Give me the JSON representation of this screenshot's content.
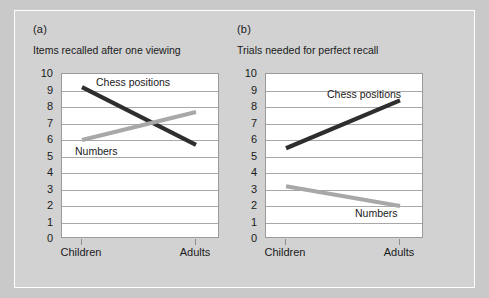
{
  "figure": {
    "background_color": "#d2d2d2",
    "plot_background_color": "#ffffff",
    "gridline_color": "#a8a8a8",
    "chess_color": "#2e2e2e",
    "numbers_color": "#a8a8a8"
  },
  "panels": [
    {
      "tag": "(a)",
      "title": "Items recalled after one viewing",
      "series_label_chess": "Chess positions",
      "series_label_numbers": "Numbers",
      "xticks": [
        "Children",
        "Adults"
      ],
      "yticks": [
        "10",
        "9",
        "8",
        "7",
        "6",
        "5",
        "4",
        "3",
        "2",
        "1",
        "0"
      ]
    },
    {
      "tag": "(b)",
      "title": "Trials needed for perfect recall",
      "series_label_chess": "Chess positions",
      "series_label_numbers": "Numbers",
      "xticks": [
        "Children",
        "Adults"
      ],
      "yticks": [
        "10",
        "9",
        "8",
        "7",
        "6",
        "5",
        "4",
        "3",
        "2",
        "1",
        "0"
      ]
    }
  ],
  "chart_data": [
    {
      "type": "line",
      "title": "Items recalled after one viewing",
      "panel": "(a)",
      "xlabel": "",
      "ylabel": "",
      "categories": [
        "Children",
        "Adults"
      ],
      "x": [
        "Children",
        "Adults"
      ],
      "ylim": [
        0,
        10
      ],
      "yticks": [
        0,
        1,
        2,
        3,
        4,
        5,
        6,
        7,
        8,
        9,
        10
      ],
      "grid": true,
      "legend": "inline-labels",
      "series": [
        {
          "name": "Chess positions",
          "values": [
            9.2,
            5.7
          ],
          "color": "#2e2e2e"
        },
        {
          "name": "Numbers",
          "values": [
            6.0,
            7.7
          ],
          "color": "#a8a8a8"
        }
      ]
    },
    {
      "type": "line",
      "title": "Trials needed for perfect recall",
      "panel": "(b)",
      "xlabel": "",
      "ylabel": "",
      "categories": [
        "Children",
        "Adults"
      ],
      "x": [
        "Children",
        "Adults"
      ],
      "ylim": [
        0,
        10
      ],
      "yticks": [
        0,
        1,
        2,
        3,
        4,
        5,
        6,
        7,
        8,
        9,
        10
      ],
      "grid": true,
      "legend": "inline-labels",
      "series": [
        {
          "name": "Chess positions",
          "values": [
            5.5,
            8.4
          ],
          "color": "#2e2e2e"
        },
        {
          "name": "Numbers",
          "values": [
            3.2,
            2.0
          ],
          "color": "#a8a8a8"
        }
      ]
    }
  ]
}
